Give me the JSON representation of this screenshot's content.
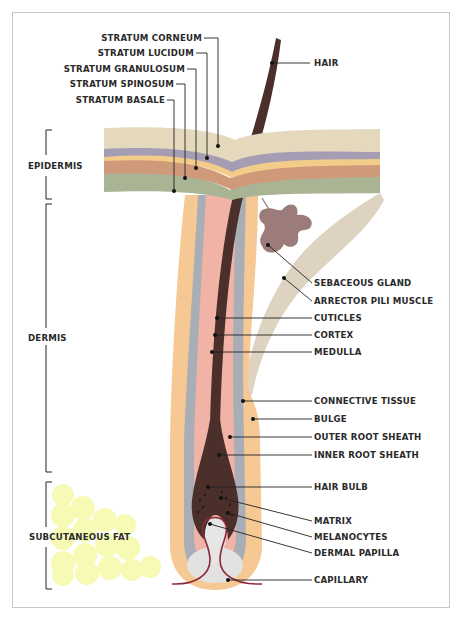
{
  "colors": {
    "stratum_corneum": "#e4d9bd",
    "stratum_lucidum": "#a59db3",
    "stratum_granulosum": "#f3cc8a",
    "stratum_spinosum": "#cf9a7a",
    "stratum_basale": "#a9b494",
    "connective_tissue": "#f6c894",
    "outer_root_sheath": "#a9aeb6",
    "inner_root_sheath": "#f1b3a6",
    "hair": "#4a2f2a",
    "sebaceous_gland": "#9c7c7a",
    "arrector_pili": "#ddd3c0",
    "dermal_papilla": "#e2e2e2",
    "capillary": "#8b2a3a",
    "fat": "#f7fab0",
    "leader_line": "#222222"
  },
  "layer_labels": {
    "stratum_corneum": "STRATUM CORNEUM",
    "stratum_lucidum": "STRATUM LUCIDUM",
    "stratum_granulosum": "STRATUM GRANULOSUM",
    "stratum_spinosum": "STRATUM SPINOSUM",
    "stratum_basale": "STRATUM BASALE"
  },
  "region_labels": {
    "epidermis": "EPIDERMIS",
    "dermis": "DERMIS",
    "subcutaneous_fat": "SUBCUTANEOUS FAT"
  },
  "right_labels": {
    "hair": "HAIR",
    "sebaceous_gland": "SEBACEOUS GLAND",
    "arrector_pili_muscle": "ARRECTOR PILI MUSCLE",
    "cuticles": "CUTICLES",
    "cortex": "CORTEX",
    "medulla": "MEDULLA",
    "connective_tissue": "CONNECTIVE TISSUE",
    "bulge": "BULGE",
    "outer_root_sheath": "OUTER ROOT SHEATH",
    "inner_root_sheath": "INNER ROOT SHEATH",
    "hair_bulb": "HAIR BULB",
    "matrix": "MATRIX",
    "melanocytes": "MELANOCYTES",
    "dermal_papilla": "DERMAL PAPILLA",
    "capillary": "CAPILLARY"
  }
}
